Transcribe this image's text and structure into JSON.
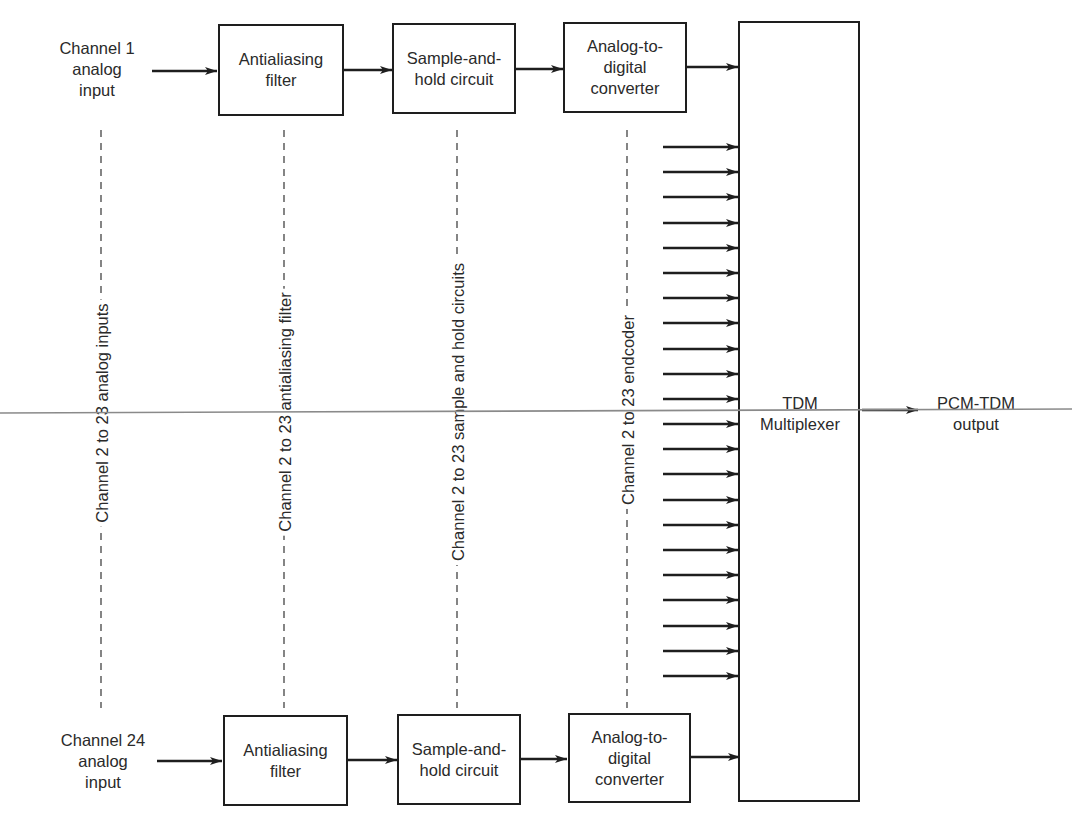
{
  "diagram": {
    "colors": {
      "stroke": "#1e1e1e",
      "text": "#2a2a2a",
      "overlay_line": "#8a8a8a",
      "background": "#ffffff"
    },
    "top_row": {
      "input_label": "Channel 1\nanalog\ninput",
      "blocks": [
        {
          "id": "aaf-1",
          "label": "Antialiasing\nfilter"
        },
        {
          "id": "sh-1",
          "label": "Sample-and-\nhold circuit"
        },
        {
          "id": "adc-1",
          "label": "Analog-to-\ndigital\nconverter"
        }
      ]
    },
    "bottom_row": {
      "input_label": "Channel 24\nanalog\ninput",
      "blocks": [
        {
          "id": "aaf-24",
          "label": "Antialiasing\nfilter"
        },
        {
          "id": "sh-24",
          "label": "Sample-and-\nhold circuit"
        },
        {
          "id": "adc-24",
          "label": "Analog-to-\ndigital\nconverter"
        }
      ]
    },
    "middle_columns": [
      {
        "id": "col-inputs",
        "label": "Channel 2 to 23 analog inputs"
      },
      {
        "id": "col-aaf",
        "label": "Channel 2 to 23 antialiasing filter"
      },
      {
        "id": "col-sh",
        "label": "Channel 2 to 23 sample and hold circuits"
      },
      {
        "id": "col-enc",
        "label": "Channel 2 to 23 endcoder"
      }
    ],
    "intermediate_channel_arrows": 22,
    "multiplexer": {
      "label": "TDM\nMultiplexer"
    },
    "output": {
      "label": "PCM-TDM\noutput"
    }
  }
}
